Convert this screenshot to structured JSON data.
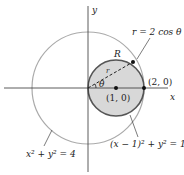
{
  "diagram": {
    "axes": {
      "x_label": "x",
      "y_label": "y"
    },
    "region_label": "R",
    "radius_label": "r",
    "angle_label": "θ",
    "points": [
      {
        "label": "(1, 0)"
      },
      {
        "label": "(2, 0)"
      }
    ],
    "curves": {
      "polar": "r = 2 cos θ",
      "small_circle": "(x − 1)² + y² = 1",
      "big_circle": "x² + y² = 4"
    },
    "colors": {
      "region_fill": "#d8d8d8",
      "small_circle_stroke": "#555555",
      "big_circle_stroke": "#aaaaaa",
      "axis": "#333333"
    }
  }
}
